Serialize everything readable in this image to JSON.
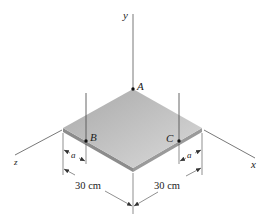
{
  "figure": {
    "type": "statics-plate-diagram"
  },
  "axes": {
    "y_label": "y",
    "x_label": "x",
    "z_label": "z"
  },
  "points": {
    "A": "A",
    "B": "B",
    "C": "C"
  },
  "dimensions": {
    "left_side": "30 cm",
    "right_side": "30 cm",
    "offset_left": "a",
    "offset_right": "a"
  },
  "colors": {
    "plate_top_light": "#d6d6d6",
    "plate_top_dark": "#a9a9a9",
    "plate_edge": "#8c8c8c",
    "lines": "#444444"
  }
}
